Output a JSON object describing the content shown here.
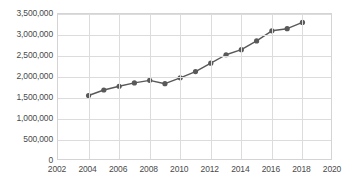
{
  "chart_data": {
    "type": "line",
    "title": "",
    "subtitle": "",
    "xlabel": "",
    "ylabel": "",
    "x": [
      2004,
      2005,
      2006,
      2007,
      2008,
      2009,
      2010,
      2011,
      2012,
      2013,
      2014,
      2015,
      2016,
      2017,
      2018
    ],
    "values": [
      1560000,
      1690000,
      1780000,
      1860000,
      1920000,
      1840000,
      1980000,
      2130000,
      2330000,
      2530000,
      2650000,
      2860000,
      3100000,
      3150000,
      3300000
    ],
    "series": [
      {
        "name": "series-1",
        "values": [
          1560000,
          1690000,
          1780000,
          1860000,
          1920000,
          1840000,
          1980000,
          2130000,
          2330000,
          2530000,
          2650000,
          2860000,
          3100000,
          3150000,
          3300000
        ]
      }
    ],
    "xlim": [
      2002,
      2020
    ],
    "ylim": [
      0,
      3500000
    ],
    "x_tick_labels": [
      "2002",
      "2004",
      "2006",
      "2008",
      "2010",
      "2012",
      "2014",
      "2016",
      "2018",
      "2020"
    ],
    "x_tick_values": [
      2002,
      2004,
      2006,
      2008,
      2010,
      2012,
      2014,
      2016,
      2018,
      2020
    ],
    "y_tick_labels": [
      "3,500,000",
      "3,000,000",
      "2,500,000",
      "2,000,000",
      "1,500,000",
      "1,000,000",
      "500,000",
      "0"
    ],
    "y_tick_values": [
      3500000,
      3000000,
      2500000,
      2000000,
      1500000,
      1000000,
      500000,
      0
    ],
    "grid": true,
    "grid_horizontal": true,
    "grid_vertical": true,
    "legend": false,
    "legend_position": "none",
    "markers": true,
    "marker_shape": "circle",
    "annotations": [],
    "colors": {
      "line": "#595959",
      "marker": "#595959",
      "grid": "#dcdcdc",
      "axis_border": "#d4d4d4",
      "tick_label": "#4a4a4a",
      "background": "#ffffff"
    }
  }
}
